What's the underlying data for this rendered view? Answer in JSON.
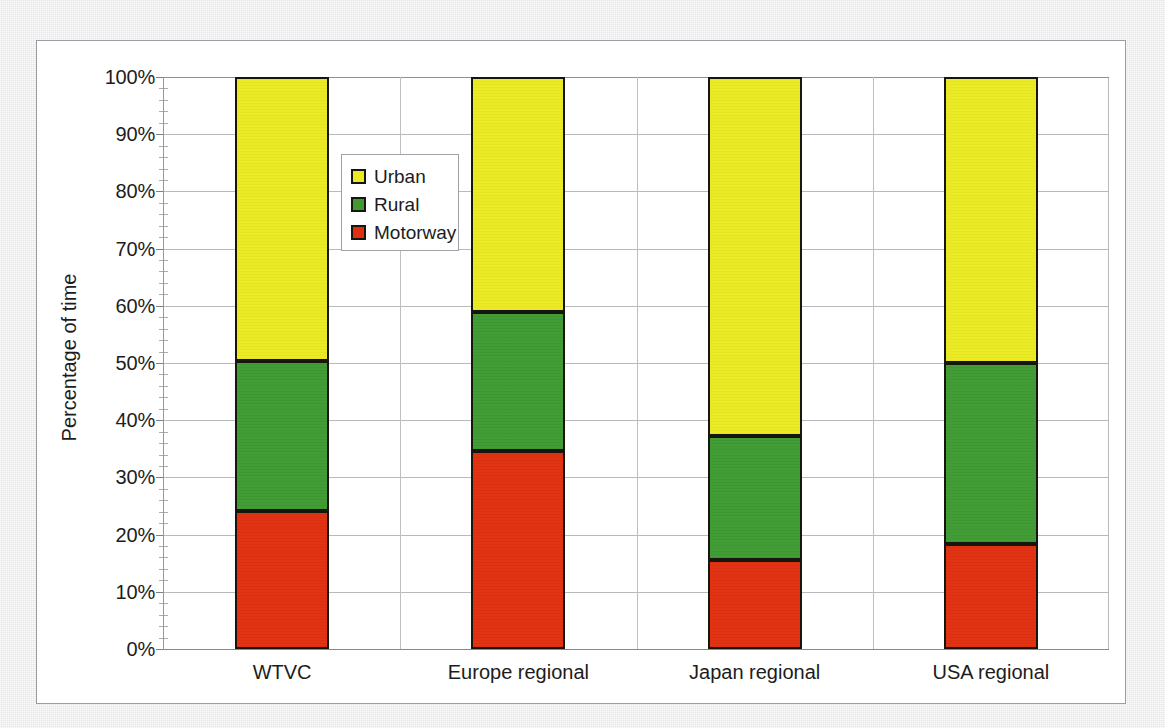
{
  "chart_data": {
    "type": "bar",
    "subtype": "stacked-100-percent",
    "title": "",
    "xlabel": "",
    "ylabel": "Percentage of time",
    "categories": [
      "WTVC",
      "Europe regional",
      "Japan regional",
      "USA regional"
    ],
    "series": [
      {
        "name": "Motorway",
        "color": "#e03010",
        "values": [
          24.2,
          34.6,
          15.6,
          18.4
        ]
      },
      {
        "name": "Rural",
        "color": "#3f9a32",
        "values": [
          26.1,
          24.4,
          21.6,
          31.6
        ]
      },
      {
        "name": "Urban",
        "color": "#eaea22",
        "values": [
          49.7,
          41.0,
          62.8,
          50.0
        ]
      }
    ],
    "ylim": [
      0,
      100
    ],
    "ytick_labels": [
      "0%",
      "10%",
      "20%",
      "30%",
      "40%",
      "50%",
      "60%",
      "70%",
      "80%",
      "90%",
      "100%"
    ],
    "ytick_values": [
      0,
      10,
      20,
      30,
      40,
      50,
      60,
      70,
      80,
      90,
      100
    ],
    "yminor_step": 2,
    "grid": {
      "horizontal": true,
      "vertical": true
    },
    "legend": {
      "position": "inside-upper-left",
      "entries": [
        {
          "label": "Urban",
          "color": "#eaea22"
        },
        {
          "label": "Rural",
          "color": "#3f9a32"
        },
        {
          "label": "Motorway",
          "color": "#e03010"
        }
      ]
    },
    "stack_boundaries_percent": {
      "WTVC": {
        "motorway_top": 24.2,
        "rural_top": 50.3
      },
      "Europe regional": {
        "motorway_top": 34.6,
        "rural_top": 59.0
      },
      "Japan regional": {
        "motorway_top": 15.6,
        "rural_top": 37.2
      },
      "USA regional": {
        "motorway_top": 18.4,
        "rural_top": 50.0
      }
    }
  },
  "axis": {
    "y_title": "Percentage of time"
  },
  "colors": {
    "urban": "#eaea22",
    "rural": "#3f9a32",
    "motorway": "#e03010",
    "bar_outline": "#16160f",
    "gridline": "#b7babd",
    "frame": "#9a9da2",
    "page_background": "#e9eaec"
  }
}
